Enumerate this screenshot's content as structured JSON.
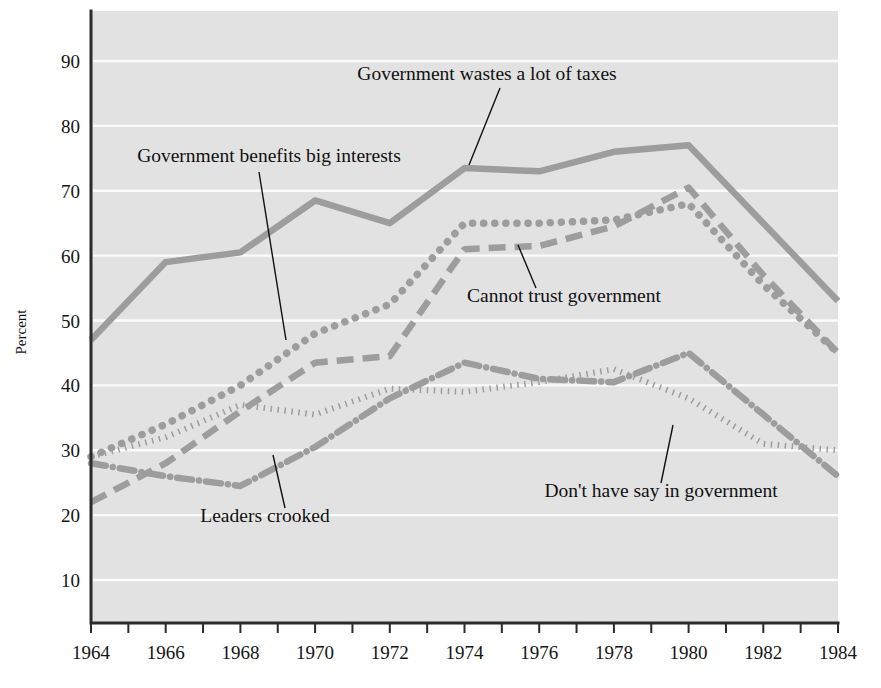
{
  "chart_data": {
    "type": "line",
    "title": "",
    "xlabel": "",
    "ylabel": "Percent",
    "xlim": [
      1964,
      1984
    ],
    "ylim": [
      0,
      95
    ],
    "grid": true,
    "legend_position": "inline-annotations",
    "x": [
      1964,
      1966,
      1968,
      1970,
      1972,
      1974,
      1976,
      1978,
      1980,
      1982,
      1984
    ],
    "x_tick_labels": [
      "1964",
      "1966",
      "1968",
      "1970",
      "1972",
      "1974",
      "1976",
      "1978",
      "1980",
      "1982",
      "1984"
    ],
    "y_tick_labels": [
      "10",
      "20",
      "30",
      "40",
      "50",
      "60",
      "70",
      "80",
      "90"
    ],
    "y_ticks": [
      10,
      20,
      30,
      40,
      50,
      60,
      70,
      80,
      90
    ],
    "series": [
      {
        "name": "Government wastes a lot of taxes",
        "style": "solid",
        "color": "#9d9d9d",
        "values": [
          47,
          59,
          60.5,
          68.5,
          65,
          73.5,
          73,
          76,
          77,
          65,
          53
        ]
      },
      {
        "name": "Government benefits big interests",
        "style": "dotted",
        "color": "#9d9d9d",
        "values": [
          29,
          34,
          40,
          48,
          52.5,
          65,
          65,
          65.5,
          68,
          55.5,
          45
        ]
      },
      {
        "name": "Cannot trust government",
        "style": "dashed",
        "color": "#9d9d9d",
        "values": [
          22,
          28,
          36,
          43.5,
          44.5,
          61,
          61.5,
          64.5,
          70.5,
          57,
          45
        ]
      },
      {
        "name": "Don't have say in government",
        "style": "fine-dotted",
        "color": "#9d9d9d",
        "values": [
          29,
          32,
          37,
          35.5,
          39.5,
          39,
          40.5,
          42.5,
          38,
          31,
          30
        ]
      },
      {
        "name": "Leaders crooked",
        "style": "dash-dot",
        "color": "#9d9d9d",
        "values": [
          28,
          26,
          24.5,
          30.5,
          38,
          43.5,
          41,
          40.5,
          45,
          35.5,
          26
        ]
      }
    ],
    "annotations": [
      {
        "id": "annot-wastes-taxes",
        "text": "Government wastes a lot of taxes",
        "text_x": 487,
        "text_y": 80,
        "anchor": "middle",
        "leader_from_x": 500,
        "leader_from_y": 88,
        "leader_to_x": 469,
        "leader_to_y": 165
      },
      {
        "id": "annot-benefits-big-interests",
        "text": "Government benefits big interests",
        "text_x": 269,
        "text_y": 162,
        "anchor": "middle",
        "leader_from_x": 259,
        "leader_from_y": 172,
        "leader_to_x": 286,
        "leader_to_y": 340
      },
      {
        "id": "annot-cannot-trust",
        "text": "Cannot trust government",
        "text_x": 564,
        "text_y": 302,
        "anchor": "middle",
        "leader_from_x": 536,
        "leader_from_y": 288,
        "leader_to_x": 518,
        "leader_to_y": 245
      },
      {
        "id": "annot-dont-have-say",
        "text": "Don't have say in government",
        "text_x": 661,
        "text_y": 497,
        "anchor": "middle",
        "leader_from_x": 661,
        "leader_from_y": 483,
        "leader_to_x": 673,
        "leader_to_y": 425
      },
      {
        "id": "annot-leaders-crooked",
        "text": "Leaders crooked",
        "text_x": 265,
        "text_y": 522,
        "anchor": "middle",
        "leader_from_x": 285,
        "leader_from_y": 508,
        "leader_to_x": 273,
        "leader_to_y": 455
      }
    ],
    "colors": {
      "plot_background": "#e2e2e2",
      "gridline": "#fbfbfb",
      "axis": "#2b2b2b",
      "series": "#9d9d9d",
      "text": "#141414",
      "page_background": "#ffffff"
    }
  }
}
